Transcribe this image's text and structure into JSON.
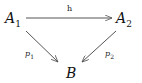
{
  "diagram": {
    "type": "commutative-diagram",
    "nodes": [
      {
        "id": "A1",
        "base": "A",
        "sub": "1"
      },
      {
        "id": "A2",
        "base": "A",
        "sub": "2"
      },
      {
        "id": "B",
        "base": "B",
        "sub": ""
      }
    ],
    "edges": [
      {
        "from": "A1",
        "to": "A2",
        "label": "h"
      },
      {
        "from": "A1",
        "to": "B",
        "label_base": "p",
        "label_sub": "1"
      },
      {
        "from": "A2",
        "to": "B",
        "label_base": "p",
        "label_sub": "2"
      }
    ],
    "colors": {
      "stroke": "#555555",
      "text": "#111111"
    }
  }
}
